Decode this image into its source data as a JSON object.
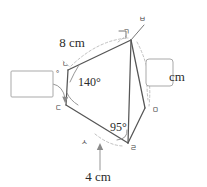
{
  "figure": {
    "kind": "geometry-diagram",
    "stroke_color": "#555555",
    "dashed_color": "#b9b9b9",
    "box_border_color": "#a9a9a9",
    "background_color": "#ffffff"
  },
  "vertices": [
    {
      "id": "g",
      "label": "ㄱ",
      "x": 131,
      "y": 40,
      "label_x": 123,
      "label_y": 34
    },
    {
      "id": "n",
      "label": "ㄴ",
      "x": 68,
      "y": 70,
      "label_x": 62,
      "label_y": 66
    },
    {
      "id": "d",
      "label": "ㄷ",
      "x": 66,
      "y": 105,
      "label_x": 55,
      "label_y": 110
    },
    {
      "id": "r",
      "label": "ㄹ",
      "x": 128,
      "y": 143,
      "label_x": 130,
      "label_y": 150
    },
    {
      "id": "m",
      "label": "ㅁ",
      "x": 145,
      "y": 108,
      "label_x": 152,
      "label_y": 112
    },
    {
      "id": "b",
      "label": "ㅂ",
      "x": 143,
      "y": 22,
      "label_x": 139,
      "label_y": 21
    },
    {
      "id": "s",
      "label": "ㅅ",
      "x": 94,
      "y": 129,
      "label_x": 81,
      "label_y": 144
    }
  ],
  "measures": {
    "side_top": {
      "value": "8 cm",
      "x": 72,
      "y": 47
    },
    "side_bottom": {
      "value": "4 cm",
      "x": 86,
      "y": 179
    },
    "angle_interior_n": {
      "value": "140°",
      "x": 78,
      "y": 85
    },
    "angle_interior_r": {
      "value": "95°",
      "x": 112,
      "y": 130
    },
    "unit_right": {
      "value": "cm",
      "x": 177,
      "y": 81
    },
    "degree_mark_left": {
      "value": "°",
      "x": 57,
      "y": 75
    }
  },
  "answer_boxes": [
    {
      "name": "angle-answer-box",
      "x": 11,
      "y": 71,
      "width": 42,
      "height": 26,
      "rx": 1
    },
    {
      "name": "length-answer-box",
      "x": 146,
      "y": 59,
      "width": 27,
      "height": 27,
      "rx": 3
    }
  ],
  "edges": [
    {
      "from": "g",
      "to": "n",
      "style": "solid"
    },
    {
      "from": "n",
      "to": "d",
      "style": "solid"
    },
    {
      "from": "d",
      "to": "r",
      "style": "solid"
    },
    {
      "from": "r",
      "to": "m",
      "style": "solid"
    },
    {
      "from": "m",
      "to": "g",
      "style": "solid"
    },
    {
      "from": "g",
      "to": "r",
      "style": "solid"
    },
    {
      "from": "g",
      "to": "b",
      "style": "thin"
    }
  ]
}
